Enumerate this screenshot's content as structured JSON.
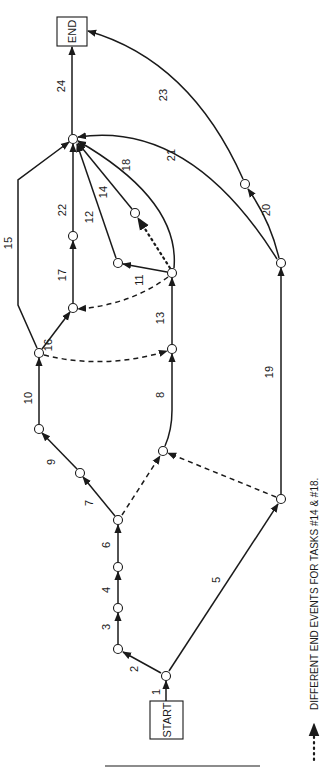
{
  "diagram": {
    "boxes": [
      {
        "id": "end",
        "label": "END",
        "x": 57,
        "y": 17,
        "w": 30,
        "h": 29
      },
      {
        "id": "start",
        "label": "START",
        "x": 150,
        "y": 701,
        "w": 33,
        "h": 38
      }
    ],
    "nodes": [
      {
        "id": "n1",
        "x": 166,
        "y": 676
      },
      {
        "id": "n2",
        "x": 118,
        "y": 649
      },
      {
        "id": "n3",
        "x": 118,
        "y": 608
      },
      {
        "id": "n4",
        "x": 118,
        "y": 567
      },
      {
        "id": "n6",
        "x": 118,
        "y": 520
      },
      {
        "id": "n7",
        "x": 80,
        "y": 473
      },
      {
        "id": "n9",
        "x": 39,
        "y": 429
      },
      {
        "id": "n10",
        "x": 39,
        "y": 353
      },
      {
        "id": "n16",
        "x": 73,
        "y": 308
      },
      {
        "id": "n17",
        "x": 73,
        "y": 236
      },
      {
        "id": "hub",
        "x": 73,
        "y": 139
      },
      {
        "id": "n8b",
        "x": 163,
        "y": 451
      },
      {
        "id": "n8t",
        "x": 172,
        "y": 349
      },
      {
        "id": "n13",
        "x": 172,
        "y": 273
      },
      {
        "id": "n12",
        "x": 118,
        "y": 263
      },
      {
        "id": "n14",
        "x": 135,
        "y": 213
      },
      {
        "id": "n5",
        "x": 281,
        "y": 499
      },
      {
        "id": "n19",
        "x": 281,
        "y": 263
      },
      {
        "id": "n20",
        "x": 245,
        "y": 184
      }
    ],
    "edges": [
      {
        "task": "1",
        "style": "solid",
        "d": "M166,701 L166,681",
        "lx": 160,
        "ly": 692
      },
      {
        "task": "2",
        "style": "solid",
        "d": "M161,673 L123,652",
        "lx": 138,
        "ly": 669
      },
      {
        "task": "3",
        "style": "solid",
        "d": "M118,644 L118,613",
        "lx": 110,
        "ly": 627
      },
      {
        "task": "4",
        "style": "solid",
        "d": "M118,603 L118,572",
        "lx": 110,
        "ly": 590
      },
      {
        "task": "6",
        "style": "solid",
        "d": "M118,562 L118,525",
        "lx": 110,
        "ly": 545
      },
      {
        "task": "7",
        "style": "solid",
        "d": "M115,516 L83,477",
        "lx": 93,
        "ly": 503
      },
      {
        "task": "9",
        "style": "solid",
        "d": "M77,469 L42,433",
        "lx": 55,
        "ly": 462
      },
      {
        "task": "10",
        "style": "solid",
        "d": "M39,424 L39,358",
        "lx": 32,
        "ly": 398
      },
      {
        "task": "16",
        "style": "solid",
        "d": "M42,349 L70,312",
        "lx": 52,
        "ly": 345
      },
      {
        "task": "15",
        "style": "solid",
        "d": "M37,348 L18,305 L18,180 L69,142",
        "lx": 12,
        "ly": 243
      },
      {
        "task": "17",
        "style": "solid",
        "d": "M73,303 L73,241",
        "lx": 66,
        "ly": 275
      },
      {
        "task": "22",
        "style": "solid",
        "d": "M73,231 L73,144",
        "lx": 66,
        "ly": 210
      },
      {
        "task": "24",
        "style": "solid",
        "d": "M72,134 L72,47",
        "lx": 65,
        "ly": 86
      },
      {
        "task": "8",
        "style": "solid",
        "d": "M165,446 Q172,430 172,410 L172,354",
        "lx": 164,
        "ly": 395
      },
      {
        "task": "13",
        "style": "solid",
        "d": "M172,344 L172,278",
        "lx": 164,
        "ly": 318
      },
      {
        "task": "11",
        "style": "solid",
        "d": "M167,272 L123,264",
        "lx": 143,
        "ly": 280
      },
      {
        "task": "12",
        "style": "solid",
        "d": "M116,258 L77,144",
        "lx": 93,
        "ly": 217
      },
      {
        "task": "14",
        "style": "solid",
        "d": "M132,209 L78,143",
        "lx": 107,
        "ly": 192
      },
      {
        "task": "18",
        "style": "solid",
        "d": "M174,268 Q180,200 78,141",
        "lx": 130,
        "ly": 165
      },
      {
        "task": "21",
        "style": "solid",
        "d": "M277,259 Q190,120 78,137",
        "lx": 175,
        "ly": 155
      },
      {
        "task": "19",
        "style": "solid",
        "d": "M281,494 L281,268",
        "lx": 273,
        "ly": 372
      },
      {
        "task": "20",
        "style": "solid",
        "d": "M279,258 Q270,220 248,189",
        "lx": 270,
        "ly": 210
      },
      {
        "task": "23",
        "style": "solid",
        "d": "M243,179 Q190,60 88,31",
        "lx": 167,
        "ly": 95
      },
      {
        "task": "5",
        "style": "solid",
        "d": "M169,671 L278,504",
        "lx": 220,
        "ly": 580
      },
      {
        "task": "",
        "style": "dashed",
        "d": "M122,515 L160,456",
        "lx": 0,
        "ly": 0
      },
      {
        "task": "",
        "style": "dashed",
        "d": "M276,497 L168,453",
        "lx": 0,
        "ly": 0
      },
      {
        "task": "",
        "style": "dashed",
        "d": "M44,355 Q105,370 167,351",
        "lx": 0,
        "ly": 0
      },
      {
        "task": "",
        "style": "dashed",
        "d": "M168,277 Q130,305 78,309",
        "lx": 0,
        "ly": 0
      },
      {
        "task": "",
        "style": "dotted",
        "d": "M170,268 L138,218",
        "lx": 0,
        "ly": 0
      }
    ],
    "separator": {
      "x1": 105,
      "y1": 766,
      "x2": 260,
      "y2": 766
    },
    "legend": {
      "symbol": "dotted-arrow",
      "text": "DIFFERENT END EVENTS FOR TASKS #14 & #18."
    }
  }
}
